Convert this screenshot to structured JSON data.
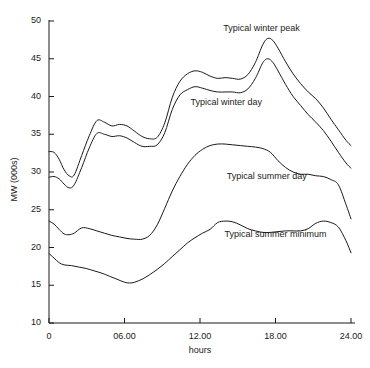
{
  "chart_data": {
    "type": "line",
    "title": "",
    "xlabel": "hours",
    "ylabel": "MW (000s)",
    "xlim": [
      0,
      24
    ],
    "ylim": [
      10,
      50
    ],
    "grid": false,
    "legend_position": "inline-annotations",
    "x_ticks": [
      "0",
      "06.00",
      "12.00",
      "18.00",
      "24.00"
    ],
    "x_tick_values": [
      0,
      6,
      12,
      18,
      24
    ],
    "y_ticks": [
      "10",
      "15",
      "20",
      "25",
      "30",
      "35",
      "40",
      "45",
      "50"
    ],
    "y_tick_values": [
      10,
      15,
      20,
      25,
      30,
      35,
      40,
      45,
      50
    ],
    "annotations": [
      {
        "text": "Typical winter peak",
        "x": 16.9,
        "y": 49.0
      },
      {
        "text": "Typical winter day",
        "x": 14.1,
        "y": 39.2
      },
      {
        "text": "Typical summer day",
        "x": 17.3,
        "y": 29.4
      },
      {
        "text": "Typical summer minimum",
        "x": 18.0,
        "y": 21.6
      }
    ],
    "series": [
      {
        "name": "Typical winter peak",
        "x": [
          0,
          0.4,
          0.8,
          1.2,
          1.6,
          2.0,
          2.6,
          3.2,
          3.8,
          4.4,
          5.0,
          5.6,
          6.2,
          6.8,
          7.4,
          8.0,
          8.6,
          9.2,
          9.8,
          10.4,
          11.0,
          11.6,
          12.2,
          12.8,
          13.4,
          14.0,
          14.6,
          15.2,
          15.8,
          16.4,
          17.0,
          17.4,
          17.8,
          18.2,
          18.8,
          19.4,
          20.0,
          20.6,
          21.2,
          21.8,
          22.4,
          23.0,
          23.6,
          24.0
        ],
        "y": [
          32.7,
          32.6,
          31.7,
          30.3,
          29.5,
          29.6,
          32.2,
          34.8,
          36.8,
          36.6,
          36.1,
          36.3,
          36.1,
          35.4,
          34.7,
          34.4,
          34.6,
          36.5,
          39.9,
          42.0,
          43.0,
          43.4,
          43.2,
          42.7,
          42.4,
          42.5,
          42.4,
          42.3,
          42.9,
          44.5,
          46.9,
          47.7,
          47.4,
          46.4,
          44.6,
          43.0,
          41.7,
          40.6,
          39.7,
          38.5,
          37.0,
          35.6,
          34.2,
          33.5
        ]
      },
      {
        "name": "Typical winter day",
        "x": [
          0,
          0.4,
          0.8,
          1.2,
          1.6,
          2.0,
          2.6,
          3.2,
          3.8,
          4.4,
          5.0,
          5.6,
          6.2,
          6.8,
          7.4,
          8.0,
          8.6,
          9.2,
          9.8,
          10.4,
          11.0,
          11.6,
          12.2,
          12.8,
          13.4,
          14.0,
          14.6,
          15.2,
          15.8,
          16.4,
          17.0,
          17.4,
          17.8,
          18.2,
          18.8,
          19.4,
          20.0,
          20.6,
          21.2,
          21.8,
          22.4,
          23.0,
          23.6,
          24.0
        ],
        "y": [
          29.3,
          29.4,
          29.1,
          28.4,
          27.9,
          28.3,
          30.6,
          33.2,
          35.1,
          35.0,
          34.7,
          34.8,
          34.5,
          33.9,
          33.4,
          33.4,
          33.6,
          35.2,
          38.3,
          40.2,
          40.9,
          41.3,
          41.1,
          40.8,
          40.6,
          40.6,
          40.6,
          40.5,
          41.0,
          42.4,
          44.5,
          45.0,
          44.5,
          43.4,
          41.6,
          40.0,
          38.8,
          37.6,
          36.6,
          35.5,
          34.1,
          32.6,
          31.2,
          30.5
        ]
      },
      {
        "name": "Typical summer day",
        "x": [
          0,
          0.4,
          0.8,
          1.2,
          1.6,
          2.0,
          2.6,
          3.2,
          3.8,
          4.4,
          5.0,
          5.6,
          6.2,
          6.8,
          7.4,
          8.0,
          8.6,
          9.2,
          9.8,
          10.4,
          11.0,
          11.6,
          12.2,
          12.8,
          13.4,
          14.0,
          14.6,
          15.2,
          15.8,
          16.4,
          17.0,
          17.6,
          18.2,
          18.8,
          19.4,
          20.0,
          20.6,
          21.2,
          21.8,
          22.4,
          23.0,
          23.6,
          24.0
        ],
        "y": [
          23.5,
          23.1,
          22.4,
          21.8,
          21.7,
          21.9,
          22.6,
          22.5,
          22.2,
          21.9,
          21.6,
          21.4,
          21.2,
          21.1,
          21.1,
          21.6,
          23.0,
          25.2,
          27.5,
          29.4,
          31.0,
          32.2,
          33.0,
          33.5,
          33.7,
          33.7,
          33.6,
          33.5,
          33.4,
          33.3,
          33.1,
          32.6,
          31.5,
          30.6,
          30.0,
          29.7,
          29.7,
          29.5,
          29.4,
          29.0,
          28.3,
          25.7,
          23.8
        ]
      },
      {
        "name": "Typical summer minimum",
        "x": [
          0,
          0.4,
          0.8,
          1.2,
          1.8,
          2.4,
          3.0,
          3.6,
          4.2,
          4.8,
          5.4,
          6.0,
          6.4,
          6.8,
          7.4,
          8.0,
          8.6,
          9.2,
          9.8,
          10.4,
          11.0,
          11.6,
          12.2,
          12.8,
          13.4,
          14.0,
          14.6,
          15.2,
          15.8,
          16.4,
          17.0,
          17.6,
          18.2,
          18.8,
          19.4,
          20.0,
          20.6,
          21.2,
          21.8,
          22.4,
          23.0,
          23.6,
          24.0
        ],
        "y": [
          19.2,
          18.6,
          18.0,
          17.7,
          17.6,
          17.4,
          17.2,
          16.9,
          16.6,
          16.2,
          15.8,
          15.4,
          15.3,
          15.4,
          15.8,
          16.4,
          17.1,
          17.9,
          18.8,
          19.7,
          20.6,
          21.3,
          21.9,
          22.4,
          23.3,
          23.5,
          23.4,
          23.0,
          22.5,
          22.2,
          22.0,
          22.0,
          22.1,
          22.2,
          22.2,
          22.2,
          22.5,
          23.2,
          23.5,
          23.3,
          22.7,
          20.9,
          19.3
        ]
      }
    ]
  },
  "style": {
    "line_color": "#1a1a1a",
    "axis_color": "#1a1a1a",
    "background": "#ffffff"
  }
}
